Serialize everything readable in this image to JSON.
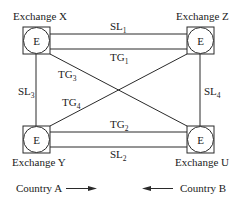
{
  "exchanges": [
    {
      "id": "X",
      "name": "Exchange X",
      "symbol": "E"
    },
    {
      "id": "Z",
      "name": "Exchange Z",
      "symbol": "E"
    },
    {
      "id": "Y",
      "name": "Exchange Y",
      "symbol": "E"
    },
    {
      "id": "U",
      "name": "Exchange U",
      "symbol": "E"
    }
  ],
  "links": {
    "SL1": {
      "base": "SL",
      "sub": "1",
      "from": "X",
      "to": "Z"
    },
    "TG1": {
      "base": "TG",
      "sub": "1",
      "from": "X",
      "to": "Z"
    },
    "TG2": {
      "base": "TG",
      "sub": "2",
      "from": "Y",
      "to": "U"
    },
    "SL2": {
      "base": "SL",
      "sub": "2",
      "from": "Y",
      "to": "U"
    },
    "SL3": {
      "base": "SL",
      "sub": "3",
      "from": "X",
      "to": "Y"
    },
    "SL4": {
      "base": "SL",
      "sub": "4",
      "from": "Z",
      "to": "U"
    },
    "TG3": {
      "base": "TG",
      "sub": "3",
      "from": "X",
      "to": "U"
    },
    "TG4": {
      "base": "TG",
      "sub": "4",
      "from": "Y",
      "to": "Z"
    }
  },
  "countries": {
    "left": {
      "label": "Country A",
      "arrow": "right"
    },
    "right": {
      "label": "Country B",
      "arrow": "left"
    }
  }
}
